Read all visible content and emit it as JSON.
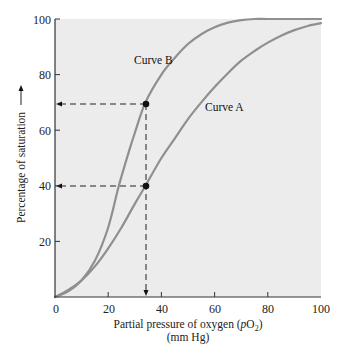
{
  "chart_data": {
    "type": "line",
    "title": "",
    "xlabel": "Partial pressure of oxygen (pO2)",
    "xlabel_line2": "(mm Hg)",
    "ylabel": "Percentage of saturation",
    "xlim": [
      0,
      100
    ],
    "ylim": [
      0,
      100
    ],
    "x_ticks": [
      0,
      20,
      40,
      60,
      80,
      100
    ],
    "y_ticks": [
      20,
      40,
      60,
      80,
      100
    ],
    "grid": false,
    "background": "#ececec",
    "series": [
      {
        "name": "Curve B",
        "color": "#8f8f8f",
        "label_pos": {
          "x": 29,
          "y": 85
        },
        "points": [
          [
            0,
            0
          ],
          [
            5,
            2
          ],
          [
            10,
            6
          ],
          [
            15,
            13
          ],
          [
            20,
            25
          ],
          [
            24,
            40
          ],
          [
            28,
            53
          ],
          [
            30,
            59
          ],
          [
            34,
            70
          ],
          [
            40,
            80
          ],
          [
            45,
            86
          ],
          [
            50,
            91
          ],
          [
            55,
            94.5
          ],
          [
            60,
            97
          ],
          [
            65,
            98.7
          ],
          [
            70,
            99.6
          ],
          [
            75,
            100
          ],
          [
            80,
            100
          ],
          [
            90,
            100
          ],
          [
            100,
            100
          ]
        ]
      },
      {
        "name": "Curve A",
        "color": "#8f8f8f",
        "label_pos": {
          "x": 65,
          "y": 65
        },
        "points": [
          [
            0,
            0
          ],
          [
            5,
            2.5
          ],
          [
            10,
            6
          ],
          [
            15,
            11
          ],
          [
            20,
            17.5
          ],
          [
            25,
            25
          ],
          [
            30,
            33.5
          ],
          [
            34,
            40
          ],
          [
            40,
            50
          ],
          [
            45,
            57
          ],
          [
            50,
            64
          ],
          [
            55,
            70
          ],
          [
            60,
            75.5
          ],
          [
            65,
            80.5
          ],
          [
            70,
            85
          ],
          [
            75,
            88.5
          ],
          [
            80,
            91.5
          ],
          [
            85,
            94
          ],
          [
            90,
            96
          ],
          [
            95,
            97.5
          ],
          [
            100,
            98.5
          ]
        ]
      }
    ],
    "annotations": [
      {
        "type": "dashed-reference",
        "point": [
          34,
          70
        ],
        "series": "Curve B",
        "arrows": [
          "to-y-axis"
        ]
      },
      {
        "type": "dashed-reference",
        "point": [
          34,
          40
        ],
        "series": "Curve A",
        "arrows": [
          "to-y-axis",
          "to-x-axis"
        ]
      }
    ]
  },
  "labels": {
    "x_axis_title": "Partial pressure of oxygen (",
    "x_axis_italic": "p",
    "x_axis_o": "O",
    "x_axis_sub": "2",
    "x_axis_close": ")",
    "x_axis_units": "(mm Hg)",
    "y_axis_title": "Percentage of saturation",
    "curve_b": "Curve B",
    "curve_a": "Curve A",
    "tick_0": "0",
    "tick_x20": "20",
    "tick_x40": "40",
    "tick_x60": "60",
    "tick_x80": "80",
    "tick_x100": "100",
    "tick_y20": "20",
    "tick_y40": "40",
    "tick_y60": "60",
    "tick_y80": "80",
    "tick_y100": "100"
  }
}
